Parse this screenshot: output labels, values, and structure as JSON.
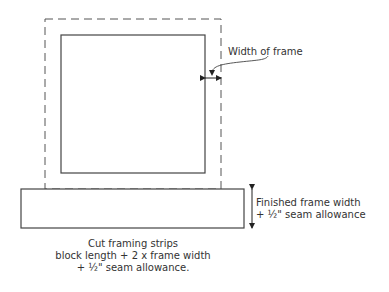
{
  "diagram": {
    "colors": {
      "line": "#444444",
      "text": "#333333",
      "background": "#ffffff"
    },
    "labels": {
      "width_of_frame": "Width of frame",
      "finished_line1": "Finished frame width",
      "finished_line2": "+ ½\" seam allowance",
      "caption_line1": "Cut framing strips",
      "caption_line2": "block length + 2 x frame width",
      "caption_line3": "+ ½\" seam allowance."
    }
  }
}
